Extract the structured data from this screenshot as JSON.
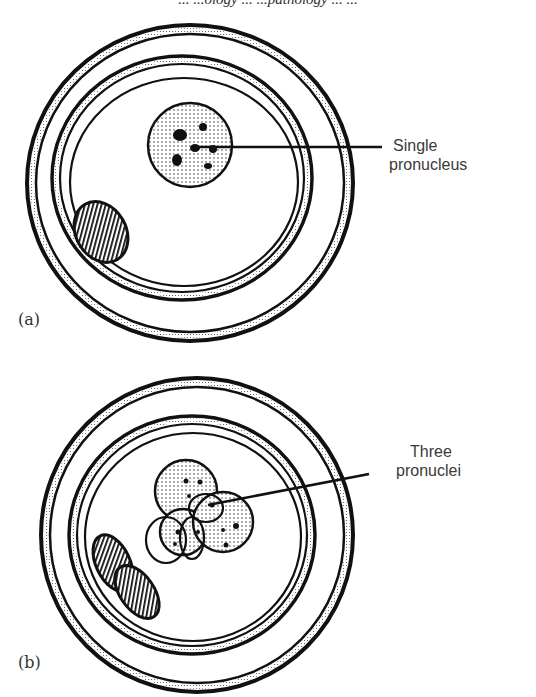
{
  "header": {
    "text": "... ...ology ... ...pathology ... ..."
  },
  "figure": {
    "panels": [
      {
        "id": "a",
        "panel_label": "(a)",
        "annotation": {
          "line1": "Single",
          "line2": "pronucleus"
        },
        "pronuclei_count": 1,
        "polar_bodies_count": 1
      },
      {
        "id": "b",
        "panel_label": "(b)",
        "annotation": {
          "line1": "Three",
          "line2": "pronuclei"
        },
        "pronuclei_count": 3,
        "polar_bodies_count": 2
      }
    ],
    "colors": {
      "ink": "#1a1a1a",
      "background": "#ffffff",
      "text": "#3a3a3a"
    }
  }
}
